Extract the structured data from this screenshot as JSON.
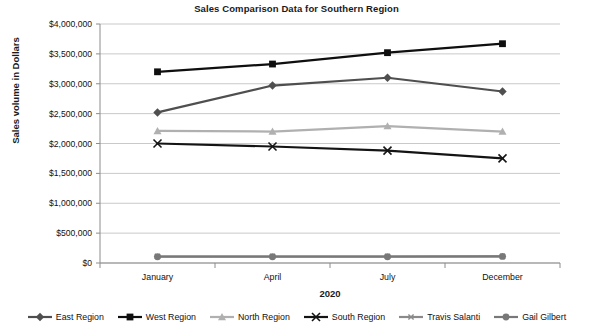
{
  "chart_data": {
    "type": "line",
    "title": "Sales Comparison Data for Southern Region",
    "xlabel": "2020",
    "ylabel": "Sales volume in Dollars",
    "categories": [
      "January",
      "April",
      "July",
      "December"
    ],
    "ylim": [
      0,
      4000000
    ],
    "ytick_step": 500000,
    "ytick_labels": [
      "$4,000,000",
      "$3,500,000",
      "$3,000,000",
      "$2,500,000",
      "$2,000,000",
      "$1,500,000",
      "$1,000,000",
      "$500,000",
      "$0"
    ],
    "ytick_values": [
      4000000,
      3500000,
      3000000,
      2500000,
      2000000,
      1500000,
      1000000,
      500000,
      0
    ],
    "grid": true,
    "legend_position": "bottom",
    "series": [
      {
        "name": "East Region",
        "values": [
          2520000,
          2970000,
          3100000,
          2870000
        ],
        "color": "#4f4f4f",
        "marker": "diamond"
      },
      {
        "name": "West Region",
        "values": [
          3200000,
          3330000,
          3520000,
          3670000
        ],
        "color": "#0f0f0f",
        "marker": "square"
      },
      {
        "name": "North Region",
        "values": [
          2210000,
          2200000,
          2290000,
          2200000
        ],
        "color": "#b0b0b0",
        "marker": "triangle"
      },
      {
        "name": "South Region",
        "values": [
          2000000,
          1950000,
          1880000,
          1750000
        ],
        "color": "#141414",
        "marker": "x"
      },
      {
        "name": "Travis Salanti",
        "values": [
          110000,
          110000,
          110000,
          110000
        ],
        "color": "#8a8a8a",
        "marker": "asterisk"
      },
      {
        "name": "Gail Gilbert",
        "values": [
          105000,
          105000,
          105000,
          110000
        ],
        "color": "#787878",
        "marker": "circle"
      }
    ]
  },
  "legend": {
    "items": [
      {
        "label": "East Region"
      },
      {
        "label": "West Region"
      },
      {
        "label": "North Region"
      },
      {
        "label": "South Region"
      },
      {
        "label": "Travis Salanti"
      },
      {
        "label": "Gail Gilbert"
      }
    ]
  }
}
